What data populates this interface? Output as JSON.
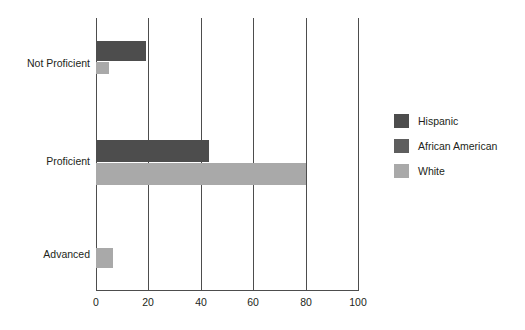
{
  "chart_data": {
    "type": "bar",
    "orientation": "horizontal",
    "title": "",
    "xlabel": "",
    "ylabel": "",
    "categories": [
      "Not Proficient",
      "Proficient",
      "Advanced"
    ],
    "series": [
      {
        "name": "Hispanic",
        "color": "#4d4d4d",
        "values": [
          19,
          43,
          0
        ]
      },
      {
        "name": "African American",
        "color": "#5e5e5e",
        "values": [
          0,
          0,
          0
        ]
      },
      {
        "name": "White",
        "color": "#a9a9a9",
        "values": [
          5,
          80,
          6.5
        ]
      }
    ],
    "xlim": [
      0,
      100
    ],
    "xticks": [
      0,
      20,
      40,
      60,
      80,
      100
    ],
    "xtick_labels": [
      "0",
      "20",
      "40",
      "60",
      "80",
      "100"
    ],
    "grid": true,
    "grid_axis": "x",
    "legend_position": "right"
  },
  "legend": {
    "entries": [
      {
        "label": "Hispanic",
        "color": "#4d4d4d"
      },
      {
        "label": "African American",
        "color": "#5e5e5e"
      },
      {
        "label": "White",
        "color": "#a9a9a9"
      }
    ]
  },
  "axis": {
    "tick_labels": [
      "0",
      "20",
      "40",
      "60",
      "80",
      "100"
    ]
  },
  "category_labels": [
    "Not Proficient",
    "Proficient",
    "Advanced"
  ]
}
